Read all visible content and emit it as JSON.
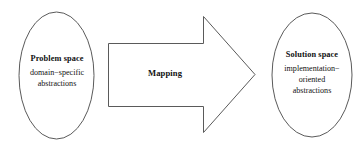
{
  "diagram": {
    "type": "process-flow",
    "background_color": "#ffffff",
    "stroke_color": "#5a5a5a",
    "text_color": "#111111",
    "nodes": [
      {
        "id": "problem-space",
        "shape": "ellipse",
        "title": "Problem space",
        "lines": [
          "domain−specific",
          "abstractions"
        ]
      },
      {
        "id": "solution-space",
        "shape": "ellipse",
        "title": "Solution space",
        "lines": [
          "implementation−",
          "oriented",
          "abstractions"
        ]
      }
    ],
    "connector": {
      "id": "mapping-arrow",
      "shape": "block-arrow",
      "direction": "right",
      "label": "Mapping",
      "from": "problem-space",
      "to": "solution-space"
    }
  }
}
